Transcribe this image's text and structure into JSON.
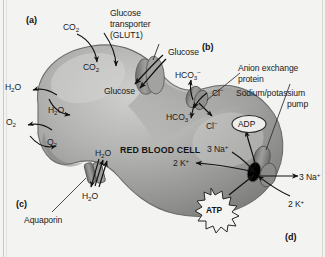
{
  "figure": {
    "cell_label": "RED BLOOD CELL",
    "colors": {
      "background": "#f3f3f1",
      "cell_fill": "#9a9a98",
      "cell_fill_light": "#c3c3c1",
      "cell_edge": "#6f6f6d",
      "protein": "#8b8b89",
      "text": "#1b1b1b"
    }
  },
  "panels": [
    {
      "id": "a",
      "label": "(a)"
    },
    {
      "id": "b",
      "label": "(b)"
    },
    {
      "id": "c",
      "label": "(c)"
    },
    {
      "id": "d",
      "label": "(d)"
    }
  ],
  "annotations": {
    "glucose_transporter": "Glucose\ntransporter\n(GLUT1)",
    "glucose_transporter_line1": "Glucose",
    "glucose_transporter_line2": "transporter",
    "glucose_transporter_line3": "(GLUT1)",
    "anion_exchange_line1": "Anion exchange",
    "anion_exchange_line2": "protein",
    "sodium_potassium_line1": "Sodium/potassium",
    "sodium_potassium_line2": "pump",
    "aquaporin": "Aquaporin"
  },
  "molecules": {
    "co2_outside": "CO2",
    "co2_inside": "CO2",
    "h2o_outside": "H2O",
    "h2o_inside": "H2O",
    "o2_outside": "O2",
    "o2_inside": "O2",
    "glucose_outside": "Glucose",
    "glucose_inside": "Glucose",
    "hco3_outside": "HCO3-",
    "hco3_inside": "HCO3-",
    "cl_outside": "Cl-",
    "cl_inside": "Cl-",
    "h2o_aqp_top": "H2O",
    "h2o_aqp_bottom": "H2O",
    "adp": "ADP",
    "atp": "ATP",
    "na_in": "3 Na+",
    "na_out": "3 Na+",
    "k_in": "2 K+",
    "k_out": "2 K+"
  },
  "transport_events": [
    {
      "species": "CO2",
      "panel": "a",
      "mechanism": "simple diffusion",
      "direction": "bidirectional"
    },
    {
      "species": "H2O",
      "panel": "a",
      "mechanism": "simple diffusion",
      "direction": "bidirectional"
    },
    {
      "species": "O2",
      "panel": "a",
      "mechanism": "simple diffusion",
      "direction": "bidirectional"
    },
    {
      "species": "Glucose",
      "panel": "a",
      "mechanism": "facilitated diffusion via GLUT1",
      "direction": "inward"
    },
    {
      "species": "HCO3-/Cl-",
      "panel": "b",
      "mechanism": "anion exchange protein",
      "direction": "antiport"
    },
    {
      "species": "H2O",
      "panel": "c",
      "mechanism": "aquaporin channel",
      "direction": "bidirectional"
    },
    {
      "species": "3 Na+ / 2 K+",
      "panel": "d",
      "mechanism": "Na+/K+ ATPase pump",
      "direction": "active transport"
    }
  ]
}
